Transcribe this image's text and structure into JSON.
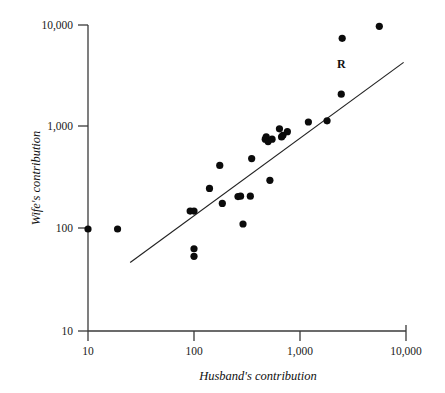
{
  "figure": {
    "title": "",
    "line_label": "R"
  },
  "axes": {
    "x": {
      "title": "Husband's contribution",
      "ticks": [
        "10",
        "100",
        "1,000",
        "10,000"
      ],
      "tick_values": [
        10,
        100,
        1000,
        10000
      ],
      "scale": "log",
      "range": [
        10,
        10000
      ]
    },
    "y": {
      "title": "Wife's contribution",
      "ticks": [
        "10",
        "100",
        "1,000",
        "10,000"
      ],
      "tick_values": [
        10,
        100,
        1000,
        10000
      ],
      "scale": "log",
      "range": [
        10,
        10000
      ]
    }
  },
  "chart_data": {
    "type": "scatter",
    "title": "",
    "xlabel": "Husband's contribution",
    "ylabel": "Wife's contribution",
    "xscale": "log",
    "yscale": "log",
    "xlim": [
      10,
      10000
    ],
    "ylim": [
      10,
      10000
    ],
    "grid": false,
    "legend": "none",
    "xticklabels": [
      "10",
      "100",
      "1,000",
      "10,000"
    ],
    "yticklabels": [
      "10",
      "100",
      "1,000",
      "10,000"
    ],
    "annotations": [
      {
        "text": "R",
        "x": 2450,
        "y": 3750,
        "note": "label for fitted regression line"
      }
    ],
    "series": [
      {
        "name": "couples",
        "marker": "filled-circle",
        "color": "#0b0b0b",
        "points": [
          {
            "x": 10,
            "y": 100
          },
          {
            "x": 19,
            "y": 100
          },
          {
            "x": 92,
            "y": 150
          },
          {
            "x": 100,
            "y": 150
          },
          {
            "x": 100,
            "y": 64
          },
          {
            "x": 100,
            "y": 54
          },
          {
            "x": 140,
            "y": 250
          },
          {
            "x": 175,
            "y": 420
          },
          {
            "x": 185,
            "y": 178
          },
          {
            "x": 260,
            "y": 208
          },
          {
            "x": 275,
            "y": 210
          },
          {
            "x": 290,
            "y": 112
          },
          {
            "x": 340,
            "y": 210
          },
          {
            "x": 350,
            "y": 490
          },
          {
            "x": 470,
            "y": 760
          },
          {
            "x": 480,
            "y": 800
          },
          {
            "x": 500,
            "y": 720
          },
          {
            "x": 520,
            "y": 300
          },
          {
            "x": 545,
            "y": 760
          },
          {
            "x": 640,
            "y": 960
          },
          {
            "x": 670,
            "y": 800
          },
          {
            "x": 690,
            "y": 830
          },
          {
            "x": 760,
            "y": 900
          },
          {
            "x": 1200,
            "y": 1120
          },
          {
            "x": 1800,
            "y": 1150
          },
          {
            "x": 2450,
            "y": 2100
          },
          {
            "x": 2500,
            "y": 7400
          },
          {
            "x": 5600,
            "y": 9700
          }
        ]
      }
    ],
    "fit_line": {
      "name": "R",
      "type": "linear-on-log-log",
      "endpoints": [
        {
          "x": 25,
          "y": 47
        },
        {
          "x": 9500,
          "y": 4300
        }
      ]
    }
  }
}
